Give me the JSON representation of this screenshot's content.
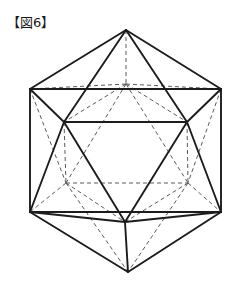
{
  "figure": {
    "label": "【図6】",
    "caption_text": "【図6】",
    "shape_name": "icosahedron",
    "style": {
      "background": "#ffffff",
      "visible_edge_color": "#1c1c1c",
      "hidden_edge_color": "#5a5a5a",
      "visible_edge_width": 1.9,
      "hidden_edge_width": 1.0,
      "hidden_edge_dash": "4 3"
    },
    "counts": {
      "vertices": 12,
      "edges": 30,
      "faces": 20
    },
    "vertices": {
      "top_apex": [
        126,
        30
      ],
      "bottom_apex": [
        128,
        272
      ],
      "hex_left_upper": [
        30,
        89
      ],
      "hex_right_upper": [
        221,
        89
      ],
      "hex_left_lower": [
        30,
        212
      ],
      "hex_right_lower": [
        221,
        212
      ],
      "upper_front_left": [
        64,
        122
      ],
      "upper_front_right": [
        187,
        122
      ],
      "upper_back_center": [
        126,
        84
      ],
      "lower_front_center": [
        125,
        222
      ],
      "lower_back_left": [
        66,
        183
      ],
      "lower_back_right": [
        188,
        183
      ]
    },
    "edges_visible": [
      [
        [
          126,
          30
        ],
        [
          30,
          89
        ]
      ],
      [
        [
          126,
          30
        ],
        [
          221,
          89
        ]
      ],
      [
        [
          126,
          30
        ],
        [
          64,
          122
        ]
      ],
      [
        [
          126,
          30
        ],
        [
          187,
          122
        ]
      ],
      [
        [
          30,
          89
        ],
        [
          221,
          89
        ]
      ],
      [
        [
          30,
          89
        ],
        [
          64,
          122
        ]
      ],
      [
        [
          30,
          89
        ],
        [
          30,
          212
        ]
      ],
      [
        [
          221,
          89
        ],
        [
          187,
          122
        ]
      ],
      [
        [
          221,
          89
        ],
        [
          221,
          212
        ]
      ],
      [
        [
          64,
          122
        ],
        [
          187,
          122
        ]
      ],
      [
        [
          64,
          122
        ],
        [
          30,
          212
        ]
      ],
      [
        [
          64,
          122
        ],
        [
          125,
          222
        ]
      ],
      [
        [
          187,
          122
        ],
        [
          221,
          212
        ]
      ],
      [
        [
          187,
          122
        ],
        [
          125,
          222
        ]
      ],
      [
        [
          30,
          212
        ],
        [
          125,
          222
        ]
      ],
      [
        [
          30,
          212
        ],
        [
          221,
          212
        ]
      ],
      [
        [
          221,
          212
        ],
        [
          125,
          222
        ]
      ],
      [
        [
          30,
          212
        ],
        [
          128,
          272
        ]
      ],
      [
        [
          221,
          212
        ],
        [
          128,
          272
        ]
      ],
      [
        [
          125,
          222
        ],
        [
          128,
          272
        ]
      ]
    ],
    "edges_hidden": [
      [
        [
          126,
          30
        ],
        [
          126,
          84
        ]
      ],
      [
        [
          126,
          84
        ],
        [
          30,
          89
        ]
      ],
      [
        [
          126,
          84
        ],
        [
          221,
          89
        ]
      ],
      [
        [
          126,
          84
        ],
        [
          64,
          122
        ]
      ],
      [
        [
          126,
          84
        ],
        [
          187,
          122
        ]
      ],
      [
        [
          126,
          84
        ],
        [
          66,
          183
        ]
      ],
      [
        [
          126,
          84
        ],
        [
          188,
          183
        ]
      ],
      [
        [
          30,
          89
        ],
        [
          66,
          183
        ]
      ],
      [
        [
          221,
          89
        ],
        [
          188,
          183
        ]
      ],
      [
        [
          64,
          122
        ],
        [
          66,
          183
        ]
      ],
      [
        [
          187,
          122
        ],
        [
          188,
          183
        ]
      ],
      [
        [
          66,
          183
        ],
        [
          188,
          183
        ]
      ],
      [
        [
          66,
          183
        ],
        [
          30,
          212
        ]
      ],
      [
        [
          188,
          183
        ],
        [
          221,
          212
        ]
      ],
      [
        [
          66,
          183
        ],
        [
          125,
          222
        ]
      ],
      [
        [
          188,
          183
        ],
        [
          125,
          222
        ]
      ],
      [
        [
          66,
          183
        ],
        [
          128,
          272
        ]
      ],
      [
        [
          188,
          183
        ],
        [
          128,
          272
        ]
      ]
    ]
  }
}
